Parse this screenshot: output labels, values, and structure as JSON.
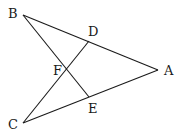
{
  "diagram": {
    "points": {
      "A": {
        "label": "A",
        "x": 158,
        "y": 70,
        "lx": 164,
        "ly": 75
      },
      "B": {
        "label": "B",
        "x": 23,
        "y": 15,
        "lx": 8,
        "ly": 18
      },
      "C": {
        "label": "C",
        "x": 23,
        "y": 123,
        "lx": 8,
        "ly": 129
      },
      "D": {
        "label": "D",
        "x": 89,
        "y": 41,
        "lx": 88,
        "ly": 36
      },
      "E": {
        "label": "E",
        "x": 89,
        "y": 97,
        "lx": 88,
        "ly": 113
      },
      "F": {
        "label": "F",
        "x": 67,
        "y": 69,
        "lx": 53,
        "ly": 75
      }
    },
    "segments": [
      "BA",
      "CA",
      "BE",
      "CD"
    ]
  }
}
